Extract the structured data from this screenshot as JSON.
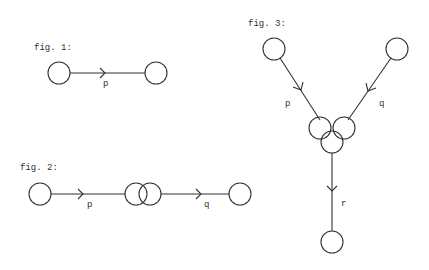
{
  "figures": [
    {
      "label": "fig. 1:",
      "edges": [
        {
          "label": "p"
        }
      ]
    },
    {
      "label": "fig. 2:",
      "edges": [
        {
          "label": "p"
        },
        {
          "label": "q"
        }
      ]
    },
    {
      "label": "fig. 3:",
      "edges": [
        {
          "label": "p"
        },
        {
          "label": "q"
        },
        {
          "label": "r"
        }
      ]
    }
  ],
  "colors": {
    "ink": "#333333",
    "background": "#ffffff"
  }
}
